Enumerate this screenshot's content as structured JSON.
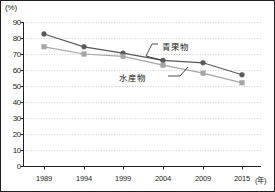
{
  "chart_data": {
    "type": "line",
    "title": "",
    "unit_label": "(%)",
    "xlabel": "(年)",
    "ylabel": "",
    "categories": [
      "1989",
      "1994",
      "1999",
      "2004",
      "2009",
      "2015"
    ],
    "series": [
      {
        "name": "青果物",
        "color": "#595959",
        "marker": "circle",
        "values": [
          82.5,
          74.5,
          70.5,
          66.0,
          64.5,
          57.0
        ]
      },
      {
        "name": "水産物",
        "color": "#a6a6a6",
        "marker": "square",
        "values": [
          74.5,
          70.0,
          68.5,
          63.0,
          58.0,
          52.0
        ]
      }
    ],
    "ylim": [
      0,
      90
    ],
    "yticks": [
      "0",
      "10",
      "20",
      "30",
      "40",
      "50",
      "60",
      "70",
      "80",
      "90"
    ],
    "grid": true,
    "grid_style": "dotted",
    "legend_position": "inline-annotation",
    "annotations": [
      {
        "text": "青果物",
        "series": "青果物"
      },
      {
        "text": "水産物",
        "series": "水産物"
      }
    ]
  },
  "colors": {
    "axis": "#231f20",
    "grid": "#b3b3b3",
    "series_dark": "#595959",
    "series_light": "#a6a6a6",
    "background": "#ffffff"
  }
}
